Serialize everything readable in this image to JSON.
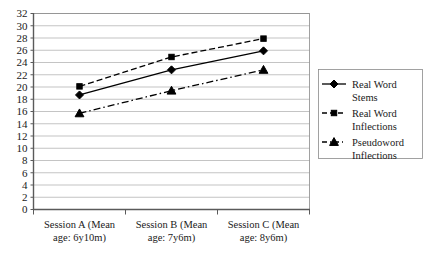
{
  "chart_data": {
    "type": "line",
    "title": "",
    "xlabel": "",
    "ylabel": "",
    "categories": [
      "Session A (Mean age: 6y10m)",
      "Session B (Mean age: 7y6m)",
      "Session C (Mean age: 8y6m)"
    ],
    "category_lines": [
      [
        "Session A (Mean",
        "age: 6y10m)"
      ],
      [
        "Session B (Mean",
        "age: 7y6m)"
      ],
      [
        "Session C (Mean",
        "age: 8y6m)"
      ]
    ],
    "series": [
      {
        "name": "Real Word Stems",
        "name_lines": [
          "Real Word",
          "Stems"
        ],
        "values": [
          18.7,
          22.8,
          25.9
        ],
        "marker": "diamond",
        "linestyle": "solid",
        "color": "#000000"
      },
      {
        "name": "Real Word Inflections",
        "name_lines": [
          "Real Word",
          "Inflections"
        ],
        "values": [
          20.1,
          24.9,
          27.9
        ],
        "marker": "square",
        "linestyle": "dashed",
        "color": "#000000"
      },
      {
        "name": "Pseudoword Inflections",
        "name_lines": [
          "Pseudoword",
          "Inflections"
        ],
        "values": [
          15.7,
          19.4,
          22.8
        ],
        "marker": "triangle",
        "linestyle": "dash-dot",
        "color": "#000000"
      }
    ],
    "ylim": [
      0,
      32
    ],
    "ytick_step": 2,
    "yticks": [
      0,
      2,
      4,
      6,
      8,
      10,
      12,
      14,
      16,
      18,
      20,
      22,
      24,
      26,
      28,
      30,
      32
    ],
    "grid": true,
    "grid_axis": "y",
    "legend_position": "right",
    "legend_border": true
  }
}
